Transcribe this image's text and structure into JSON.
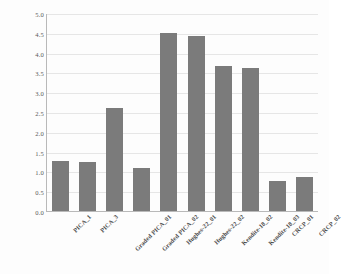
{
  "chart_data": {
    "type": "bar",
    "title": "",
    "xlabel": "",
    "ylabel": "1st Laser Exposure Mass Loss, grams",
    "ylim": [
      0.0,
      5.0
    ],
    "ytick_step": 0.5,
    "grid": true,
    "legend": "none",
    "bar_color": "#7b7b7b",
    "categories": [
      "PICA_1",
      "PICA_3",
      "Graded PICA_01",
      "Graded PICA_02",
      "Hughes-22_01",
      "Hughes-22_02",
      "Kendite-18_02",
      "Kendite-18_03",
      "CRCP_01",
      "CRCP_02"
    ],
    "values": [
      1.27,
      1.24,
      2.61,
      1.08,
      4.5,
      4.41,
      3.66,
      3.6,
      0.77,
      0.86
    ],
    "ytick_labels": [
      "0.0",
      "0.5",
      "1.0",
      "1.5",
      "2.0",
      "2.5",
      "3.0",
      "3.5",
      "4.0",
      "4.5",
      "5.0"
    ],
    "ytick_values": [
      0.0,
      0.5,
      1.0,
      1.5,
      2.0,
      2.5,
      3.0,
      3.5,
      4.0,
      4.5,
      5.0
    ]
  }
}
